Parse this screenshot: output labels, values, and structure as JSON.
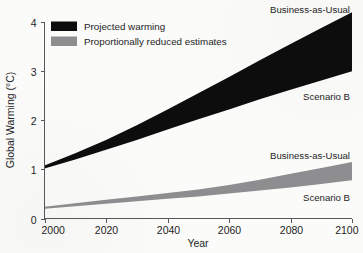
{
  "chart_data": {
    "type": "area",
    "title": "",
    "xlabel": "Year",
    "ylabel": "Global Warming (°C)",
    "xlim": [
      2000,
      2100
    ],
    "ylim": [
      0,
      4
    ],
    "grid": false,
    "legend_position": "top-left",
    "x": [
      2000,
      2010,
      2020,
      2030,
      2040,
      2050,
      2060,
      2070,
      2080,
      2090,
      2100
    ],
    "series": [
      {
        "name": "Projected warming — Business-as-Usual",
        "band": "projected",
        "bound": "upper",
        "color": "#0d0d0d",
        "values": [
          1.08,
          1.33,
          1.6,
          1.9,
          2.22,
          2.55,
          2.88,
          3.22,
          3.55,
          3.88,
          4.2
        ]
      },
      {
        "name": "Projected warming — Scenario B",
        "band": "projected",
        "bound": "lower",
        "color": "#0d0d0d",
        "values": [
          1.02,
          1.2,
          1.4,
          1.6,
          1.81,
          2.02,
          2.22,
          2.43,
          2.62,
          2.81,
          3.0
        ]
      },
      {
        "name": "Proportionally reduced estimates — Business-as-Usual",
        "band": "reduced",
        "bound": "upper",
        "color": "#8e8e90",
        "values": [
          0.24,
          0.31,
          0.38,
          0.45,
          0.52,
          0.59,
          0.68,
          0.79,
          0.91,
          1.03,
          1.15
        ]
      },
      {
        "name": "Proportionally reduced estimates — Scenario B",
        "band": "reduced",
        "bound": "lower",
        "color": "#8e8e90",
        "values": [
          0.2,
          0.25,
          0.3,
          0.35,
          0.4,
          0.45,
          0.51,
          0.57,
          0.63,
          0.7,
          0.78
        ]
      }
    ],
    "xticks": [
      {
        "value": 2000,
        "label": "2000"
      },
      {
        "value": 2020,
        "label": "2020"
      },
      {
        "value": 2040,
        "label": "2040"
      },
      {
        "value": 2060,
        "label": "2060"
      },
      {
        "value": 2080,
        "label": "2080"
      },
      {
        "value": 2100,
        "label": "2100"
      }
    ],
    "yticks": [
      {
        "value": 0,
        "label": "0"
      },
      {
        "value": 1,
        "label": "1"
      },
      {
        "value": 2,
        "label": "2"
      },
      {
        "value": 3,
        "label": "3"
      },
      {
        "value": 4,
        "label": "4"
      }
    ],
    "legend": [
      {
        "label": "Projected warming",
        "color": "#0d0d0d"
      },
      {
        "label": "Proportionally reduced estimates",
        "color": "#8e8e90"
      }
    ],
    "annotations": [
      {
        "text": "Business-as-Usual",
        "for": "projected-upper"
      },
      {
        "text": "Scenario B",
        "for": "projected-lower"
      },
      {
        "text": "Business-as-Usual",
        "for": "reduced-upper"
      },
      {
        "text": "Scenario B",
        "for": "reduced-lower"
      }
    ]
  }
}
